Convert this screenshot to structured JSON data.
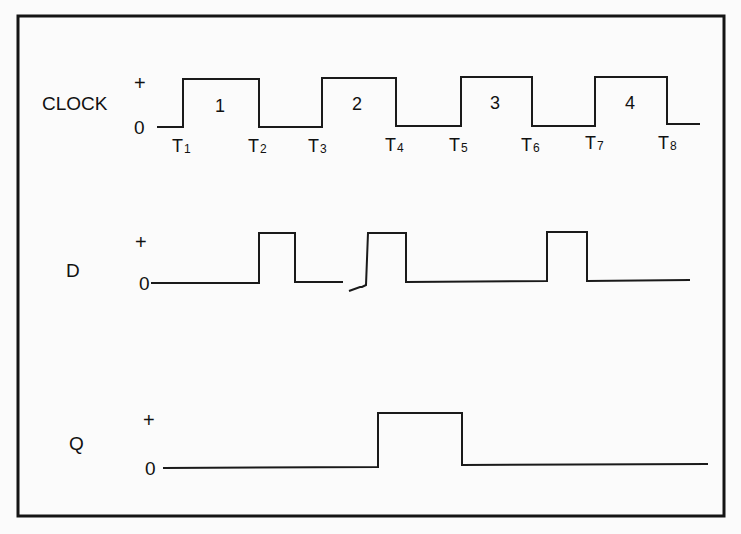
{
  "diagram": {
    "title": "",
    "signals": [
      {
        "name": "CLOCK",
        "high_label": "+",
        "low_label": "0",
        "levels": [
          "low",
          "high",
          "low",
          "high",
          "low",
          "high",
          "low",
          "high",
          "low"
        ],
        "pulse_labels": [
          "1",
          "2",
          "3",
          "4"
        ]
      },
      {
        "name": "D",
        "high_label": "+",
        "low_label": "0",
        "levels": [
          "low",
          "high",
          "low",
          "high",
          "low",
          "high",
          "low"
        ]
      },
      {
        "name": "Q",
        "high_label": "+",
        "low_label": "0",
        "levels": [
          "low",
          "high",
          "low"
        ]
      }
    ],
    "time_markers": [
      {
        "base": "T",
        "sub": "1"
      },
      {
        "base": "T",
        "sub": "2"
      },
      {
        "base": "T",
        "sub": "3"
      },
      {
        "base": "T",
        "sub": "4"
      },
      {
        "base": "T",
        "sub": "5"
      },
      {
        "base": "T",
        "sub": "6"
      },
      {
        "base": "T",
        "sub": "7"
      },
      {
        "base": "T",
        "sub": "8"
      }
    ]
  }
}
